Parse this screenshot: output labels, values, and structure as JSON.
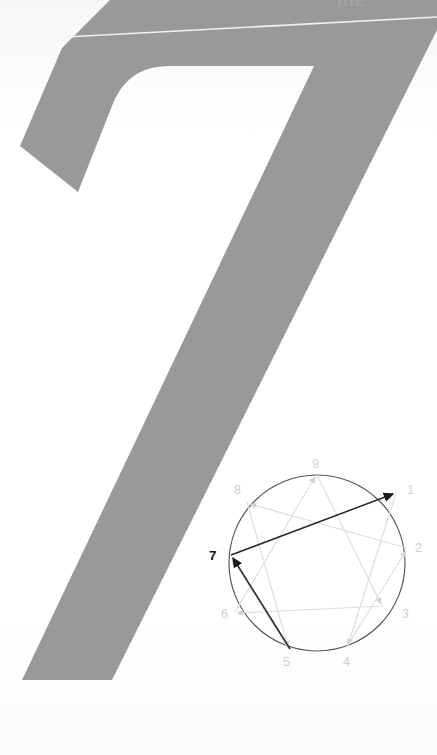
{
  "page": {
    "background_color": "#fdfdfd",
    "width": 437,
    "height": 755,
    "cropped_header_text": "IIIE"
  },
  "hero": {
    "numeral": "7",
    "description": "large gray numeral seven filling upper page",
    "fill_color": "#999999",
    "hairline_color": "#f2f2f2"
  },
  "enneagram": {
    "title": "Enneagram diagram",
    "circle_color": "#555555",
    "faint_line_color": "#dcdcdc",
    "highlight_line_color": "#333333",
    "active_point": "7",
    "active_label_color": "#1a1a1a",
    "inactive_label_color": "#cfcfcf",
    "points": [
      {
        "id": "1",
        "label": "1",
        "x": 191.5,
        "y": 44.0,
        "lx": 202,
        "ly": 41,
        "active": false
      },
      {
        "id": "2",
        "label": "2",
        "x": 202.0,
        "y": 100.0,
        "lx": 210,
        "ly": 99,
        "active": false
      },
      {
        "id": "3",
        "label": "3",
        "x": 178.0,
        "y": 158.0,
        "lx": 196,
        "ly": 166,
        "active": false
      },
      {
        "id": "4",
        "label": "4",
        "x": 141.5,
        "y": 200.0,
        "lx": 140,
        "ly": 213,
        "active": false
      },
      {
        "id": "5",
        "label": "5",
        "x": 84.0,
        "y": 202.5,
        "lx": 80,
        "ly": 213,
        "active": false
      },
      {
        "id": "6",
        "label": "6",
        "x": 30.0,
        "y": 165.5,
        "lx": 22,
        "ly": 167,
        "active": false
      },
      {
        "id": "7",
        "label": "7",
        "x": 25.5,
        "y": 107.0,
        "lx": 9,
        "ly": 104,
        "active": true
      },
      {
        "id": "8",
        "label": "8",
        "x": 42.0,
        "y": 53.0,
        "lx": 33,
        "ly": 45,
        "active": false
      },
      {
        "id": "9",
        "label": "9",
        "x": 112.0,
        "y": 25.5,
        "lx": 110,
        "ly": 16,
        "active": false
      }
    ],
    "faint_connections": [
      {
        "from": "9",
        "to": "3"
      },
      {
        "from": "3",
        "to": "6"
      },
      {
        "from": "6",
        "to": "9"
      },
      {
        "from": "1",
        "to": "4"
      },
      {
        "from": "4",
        "to": "2"
      },
      {
        "from": "2",
        "to": "8"
      },
      {
        "from": "8",
        "to": "5"
      },
      {
        "from": "5",
        "to": "7"
      },
      {
        "from": "7",
        "to": "1"
      }
    ],
    "highlight_connections": [
      {
        "from": "7",
        "to": "1",
        "arrow": "to-1"
      },
      {
        "from": "5",
        "to": "7",
        "arrow": "to-7"
      }
    ]
  }
}
